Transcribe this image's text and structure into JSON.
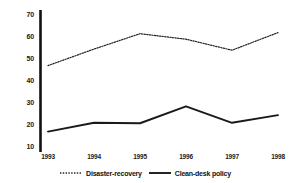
{
  "chart_data": {
    "type": "line",
    "title": "",
    "subtitle": "",
    "xlabel": "",
    "ylabel": "",
    "categories": [
      "1993",
      "1994",
      "1995",
      "1996",
      "1997",
      "1998"
    ],
    "x": [
      1993,
      1994,
      1995,
      1996,
      1997,
      1998
    ],
    "xlim": [
      1993,
      1998
    ],
    "ylim": [
      10,
      70
    ],
    "yticks": [
      10,
      20,
      30,
      40,
      50,
      60,
      70
    ],
    "ytick_labels": [
      "10",
      "20",
      "30",
      "40",
      "50",
      "60",
      "70"
    ],
    "xtick_labels": [
      "1993",
      "1994",
      "1995",
      "1996",
      "1997",
      "1998"
    ],
    "grid": false,
    "legend_position": "bottom-center",
    "series": [
      {
        "name": "Disaster-recovery",
        "style": "dotted",
        "color": "#222222",
        "values": [
          47,
          54.5,
          61.5,
          59,
          54,
          62
        ]
      },
      {
        "name": "Clean-desk policy",
        "style": "solid",
        "color": "#1a1a1a",
        "values": [
          17,
          21,
          20.8,
          28.5,
          21,
          24.5
        ]
      }
    ]
  },
  "legend": {
    "entries": [
      {
        "label": "Disaster-recovery",
        "swatch": "dotted-line-swatch"
      },
      {
        "label": "Clean-desk policy",
        "swatch": "solid-line-swatch"
      }
    ]
  },
  "axes": {
    "y_axis_line_color": "#111111",
    "background": "#ffffff"
  }
}
